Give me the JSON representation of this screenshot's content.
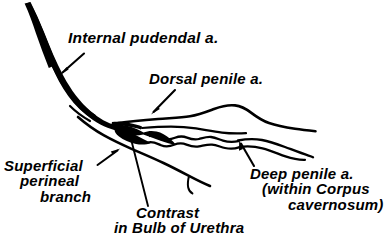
{
  "figure": {
    "kind": "anatomical-line-drawing",
    "background_color": "#ffffff",
    "ink_color": "#000000"
  },
  "labels": {
    "internal_pudendal": {
      "text": "Internal pudendal a.",
      "lines": [
        "Internal pudendal a."
      ]
    },
    "dorsal_penile": {
      "text": "Dorsal penile a.",
      "lines": [
        "Dorsal penile a."
      ]
    },
    "superficial_perineal": {
      "line1": "Superficial",
      "line2": "perineal",
      "line3": "branch"
    },
    "contrast_bulb": {
      "line1": "Contrast",
      "line2": "in Bulb of Urethra"
    },
    "deep_penile": {
      "line1": "Deep penile a.",
      "line2": "(within Corpus",
      "line3": "cavernosum)"
    }
  },
  "structures": [
    {
      "name": "internal-pudendal-artery-trunk",
      "description": "thick tapering black trunk descending from top-left and curving to the right"
    },
    {
      "name": "dorsal-penile-artery",
      "description": "upper arcing vessel running right from the branch point"
    },
    {
      "name": "deep-penile-artery",
      "description": "wavy vessel pair within the corpus cavernosum"
    },
    {
      "name": "contrast-blob",
      "description": "dense irregular black mass of contrast in the bulb of the urethra"
    },
    {
      "name": "superficial-perineal-branch",
      "description": "long thin vessel descending to the lower right with a small hooked side branch"
    }
  ],
  "pointers": [
    {
      "name": "arrow-internal-pudendal",
      "type": "arrow",
      "from": [
        84,
        54
      ],
      "to": [
        60,
        75
      ]
    },
    {
      "name": "arrow-dorsal-penile",
      "type": "arrow",
      "from": [
        175,
        90
      ],
      "to": [
        151,
        114
      ]
    },
    {
      "name": "arrow-superficial-perineal",
      "type": "arrow",
      "from": [
        98,
        165
      ],
      "to": [
        120,
        148
      ]
    },
    {
      "name": "arrow-deep-penile",
      "type": "arrow",
      "from": [
        254,
        166
      ],
      "to": [
        239,
        140
      ]
    },
    {
      "name": "leader-contrast",
      "type": "line",
      "from": [
        148,
        206
      ],
      "to": [
        131,
        140
      ]
    }
  ]
}
